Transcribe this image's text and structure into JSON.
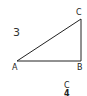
{
  "figure": {
    "problem_number": "3",
    "triangle": {
      "vertices": [
        "A",
        "B",
        "C"
      ],
      "right_angle_at": "B"
    },
    "next_figure": {
      "vertex_label": "C",
      "problem_number_partial": "4"
    }
  },
  "colors": {
    "line": "#222222",
    "text": "#222222"
  }
}
